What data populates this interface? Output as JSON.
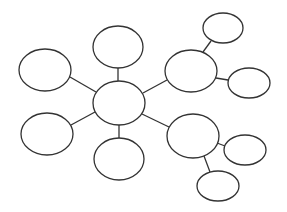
{
  "diagram": {
    "type": "mind-map",
    "stroke_color": "#333333",
    "fill_color": "#ffffff",
    "background": "#ffffff",
    "nodes": [
      {
        "id": "center",
        "cx": 119,
        "cy": 103,
        "rx": 26,
        "ry": 22,
        "label": ""
      },
      {
        "id": "top",
        "cx": 118,
        "cy": 47,
        "rx": 25,
        "ry": 21,
        "label": ""
      },
      {
        "id": "left-upper",
        "cx": 45,
        "cy": 70,
        "rx": 26,
        "ry": 21,
        "label": ""
      },
      {
        "id": "left-lower",
        "cx": 47,
        "cy": 134,
        "rx": 26,
        "ry": 21,
        "label": ""
      },
      {
        "id": "bottom",
        "cx": 119,
        "cy": 159,
        "rx": 25,
        "ry": 21,
        "label": ""
      },
      {
        "id": "right-upper",
        "cx": 191,
        "cy": 71,
        "rx": 26,
        "ry": 21,
        "label": ""
      },
      {
        "id": "right-upper-top",
        "cx": 223,
        "cy": 28,
        "rx": 20,
        "ry": 15,
        "label": ""
      },
      {
        "id": "right-upper-side",
        "cx": 249,
        "cy": 83,
        "rx": 21,
        "ry": 15,
        "label": ""
      },
      {
        "id": "right-lower",
        "cx": 193,
        "cy": 136,
        "rx": 26,
        "ry": 22,
        "label": ""
      },
      {
        "id": "right-lower-side",
        "cx": 245,
        "cy": 150,
        "rx": 21,
        "ry": 15,
        "label": ""
      },
      {
        "id": "right-lower-bottom",
        "cx": 218,
        "cy": 186,
        "rx": 21,
        "ry": 15,
        "label": ""
      }
    ],
    "edges": [
      {
        "from": "center",
        "to": "top",
        "x1": 118,
        "y1": 81,
        "x2": 118,
        "y2": 68
      },
      {
        "from": "center",
        "to": "left-upper",
        "x1": 96,
        "y1": 92,
        "x2": 70,
        "y2": 77
      },
      {
        "from": "center",
        "to": "left-lower",
        "x1": 95,
        "y1": 112,
        "x2": 71,
        "y2": 125
      },
      {
        "from": "center",
        "to": "bottom",
        "x1": 119,
        "y1": 125,
        "x2": 119,
        "y2": 138
      },
      {
        "from": "center",
        "to": "right-upper",
        "x1": 143,
        "y1": 93,
        "x2": 167,
        "y2": 80
      },
      {
        "from": "center",
        "to": "right-lower",
        "x1": 142,
        "y1": 114,
        "x2": 169,
        "y2": 127
      },
      {
        "from": "right-upper",
        "to": "right-upper-top",
        "x1": 203,
        "y1": 52,
        "x2": 211,
        "y2": 41
      },
      {
        "from": "right-upper",
        "to": "right-upper-side",
        "x1": 216,
        "y1": 78,
        "x2": 228,
        "y2": 80
      },
      {
        "from": "right-lower",
        "to": "right-lower-side",
        "x1": 217,
        "y1": 143,
        "x2": 225,
        "y2": 146
      },
      {
        "from": "right-lower",
        "to": "right-lower-bottom",
        "x1": 204,
        "y1": 156,
        "x2": 210,
        "y2": 172
      }
    ]
  }
}
